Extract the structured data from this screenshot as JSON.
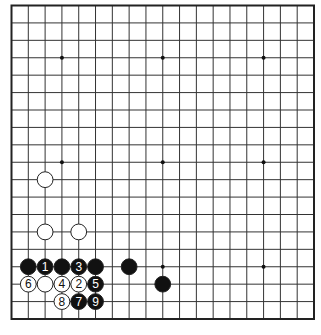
{
  "diagram": {
    "type": "go-board",
    "size": 19,
    "colors": {
      "background": "#ffffff",
      "grid_line": "#333333",
      "border": "#222222",
      "black_stone": "#111111",
      "white_stone": "#ffffff",
      "stone_outline": "#222222"
    },
    "star_points": [
      [
        3,
        3
      ],
      [
        9,
        3
      ],
      [
        15,
        3
      ],
      [
        3,
        9
      ],
      [
        9,
        9
      ],
      [
        15,
        9
      ],
      [
        3,
        15
      ],
      [
        9,
        15
      ],
      [
        15,
        15
      ]
    ],
    "stones": [
      {
        "col": 2,
        "row": 10,
        "color": "white",
        "label": ""
      },
      {
        "col": 2,
        "row": 13,
        "color": "white",
        "label": ""
      },
      {
        "col": 4,
        "row": 13,
        "color": "white",
        "label": ""
      },
      {
        "col": 1,
        "row": 15,
        "color": "black",
        "label": ""
      },
      {
        "col": 2,
        "row": 15,
        "color": "black",
        "label": "1"
      },
      {
        "col": 3,
        "row": 15,
        "color": "black",
        "label": ""
      },
      {
        "col": 4,
        "row": 15,
        "color": "black",
        "label": "3"
      },
      {
        "col": 5,
        "row": 15,
        "color": "black",
        "label": ""
      },
      {
        "col": 7,
        "row": 15,
        "color": "black",
        "label": ""
      },
      {
        "col": 1,
        "row": 16,
        "color": "white",
        "label": "6"
      },
      {
        "col": 2,
        "row": 16,
        "color": "white",
        "label": ""
      },
      {
        "col": 3,
        "row": 16,
        "color": "white",
        "label": "4"
      },
      {
        "col": 4,
        "row": 16,
        "color": "white",
        "label": "2"
      },
      {
        "col": 5,
        "row": 16,
        "color": "black",
        "label": "5"
      },
      {
        "col": 9,
        "row": 16,
        "color": "black",
        "label": ""
      },
      {
        "col": 3,
        "row": 17,
        "color": "white",
        "label": "8"
      },
      {
        "col": 4,
        "row": 17,
        "color": "black",
        "label": "7"
      },
      {
        "col": 5,
        "row": 17,
        "color": "black",
        "label": "9"
      }
    ]
  }
}
